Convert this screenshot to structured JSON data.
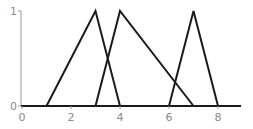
{
  "chart_data": {
    "type": "line",
    "title": "",
    "xlabel": "",
    "ylabel": "",
    "xlim": [
      0,
      8.9
    ],
    "ylim": [
      0,
      1
    ],
    "x_ticks": [
      0,
      2,
      4,
      6,
      8
    ],
    "x_tick_labels": [
      "0",
      "2",
      "4",
      "6",
      "8"
    ],
    "y_ticks": [
      0,
      1
    ],
    "y_tick_labels": [
      "0",
      "1"
    ],
    "grid": false,
    "legend": null,
    "series": [
      {
        "name": "triangle-1",
        "x": [
          1,
          3,
          4
        ],
        "y": [
          0,
          1,
          0
        ]
      },
      {
        "name": "triangle-2",
        "x": [
          3,
          4,
          7
        ],
        "y": [
          0,
          1,
          0
        ]
      },
      {
        "name": "triangle-3",
        "x": [
          6,
          7,
          8
        ],
        "y": [
          0,
          1,
          0
        ]
      }
    ]
  },
  "layout": {
    "x0_px": 22,
    "px_per_x": 24.5,
    "y0_px": 106,
    "y1_px": 11,
    "x_axis_end_px": 241
  },
  "colors": {
    "line": "#1a1a1a",
    "axis": "#1a1a1a",
    "y_axis": "#9a9a9a",
    "tick_label": "#8a8a8a"
  }
}
